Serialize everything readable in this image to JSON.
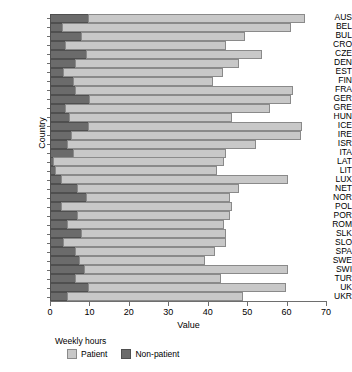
{
  "chart_data": {
    "type": "bar",
    "orientation": "horizontal",
    "stacked": true,
    "title": "",
    "xlabel": "Value",
    "ylabel": "Country",
    "xlim": [
      0,
      70
    ],
    "xticks": [
      0,
      10,
      20,
      30,
      40,
      50,
      60,
      70
    ],
    "grid": false,
    "legend_title": "Weekly hours",
    "legend_position": "bottom-left",
    "categories": [
      "AUS",
      "BEL",
      "BUL",
      "CRO",
      "CZE",
      "DEN",
      "EST",
      "FIN",
      "FRA",
      "GER",
      "GRE",
      "HUN",
      "ICE",
      "IRE",
      "ISR",
      "ITA",
      "LAT",
      "LIT",
      "LUX",
      "NET",
      "NOR",
      "POL",
      "POR",
      "ROM",
      "SLK",
      "SLO",
      "SPA",
      "SWE",
      "SWI",
      "TUR",
      "UK",
      "UKR"
    ],
    "series": [
      {
        "name": "Non-patient",
        "color": "#6b6b6b",
        "values": [
          10.0,
          3.2,
          8.0,
          4.0,
          9.5,
          6.5,
          3.5,
          6.0,
          6.5,
          10.2,
          4.0,
          5.0,
          10.0,
          5.5,
          4.5,
          6.0,
          1.0,
          1.5,
          3.0,
          7.2,
          9.5,
          3.0,
          7.0,
          4.5,
          8.2,
          3.5,
          6.5,
          7.5,
          9.0,
          6.5,
          9.8,
          4.5
        ]
      },
      {
        "name": "Patient",
        "color": "#c8c8c8",
        "values": [
          55.0,
          58.1,
          41.7,
          41.0,
          44.4,
          41.7,
          40.7,
          35.5,
          55.5,
          51.3,
          52.0,
          41.5,
          54.2,
          58.5,
          48.0,
          39.0,
          43.5,
          41.0,
          57.5,
          41.0,
          36.5,
          43.5,
          39.0,
          40.0,
          36.8,
          41.5,
          35.5,
          32.0,
          51.5,
          37.0,
          50.2,
          44.8
        ]
      }
    ],
    "totals": [
      65.0,
      61.3,
      49.7,
      45.0,
      53.9,
      48.2,
      44.2,
      41.5,
      62.0,
      61.5,
      56.0,
      46.5,
      64.2,
      64.0,
      52.5,
      45.0,
      44.5,
      42.5,
      60.5,
      48.2,
      46.0,
      46.5,
      46.0,
      44.5,
      45.0,
      45.0,
      42.0,
      39.5,
      60.5,
      43.5,
      60.0,
      49.3
    ]
  }
}
